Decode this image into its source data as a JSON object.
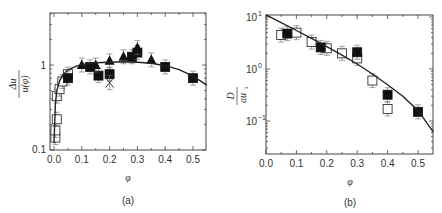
{
  "chart_data": [
    {
      "type": "scatter",
      "panel_label": "(a)",
      "xlabel": "φ",
      "ylabel": "Δu / u(φ)",
      "xlim": [
        -0.015,
        0.55
      ],
      "ylim": [
        0.1,
        4.1
      ],
      "yscale": "log",
      "xticks": [
        "0.0",
        "0.1",
        "0.2",
        "0.3",
        "0.4",
        "0.5"
      ],
      "yticks": [
        "0.1",
        "1"
      ],
      "grid": false,
      "legend": null,
      "series": [
        {
          "name": "open squares",
          "marker": "open-square",
          "x": [
            0.005,
            0.005,
            0.01,
            0.01,
            0.02,
            0.03,
            0.05
          ],
          "y": [
            0.14,
            0.17,
            0.23,
            0.43,
            0.52,
            0.64,
            0.78
          ]
        },
        {
          "name": "filled squares",
          "marker": "filled-square",
          "x": [
            0.05,
            0.13,
            0.16,
            0.2,
            0.28,
            0.3,
            0.4,
            0.5
          ],
          "y": [
            0.7,
            0.95,
            0.75,
            0.78,
            1.25,
            1.4,
            0.95,
            0.7
          ]
        },
        {
          "name": "filled triangles",
          "marker": "filled-triangle",
          "x": [
            0.1,
            0.15,
            0.2,
            0.25,
            0.3,
            0.35
          ],
          "y": [
            1.0,
            1.0,
            1.12,
            1.25,
            1.6,
            1.15
          ]
        },
        {
          "name": "crosses",
          "marker": "x",
          "x": [
            0.2
          ],
          "y": [
            0.62
          ]
        },
        {
          "name": "fit curve",
          "marker": "line",
          "x": [
            0.0,
            0.005,
            0.01,
            0.02,
            0.03,
            0.05,
            0.08,
            0.1,
            0.15,
            0.2,
            0.25,
            0.3,
            0.35,
            0.4,
            0.45,
            0.5,
            0.55
          ],
          "y": [
            0.12,
            0.35,
            0.5,
            0.65,
            0.75,
            0.87,
            0.97,
            1.01,
            1.06,
            1.08,
            1.09,
            1.08,
            1.05,
            0.98,
            0.88,
            0.74,
            0.58
          ]
        }
      ]
    },
    {
      "type": "scatter",
      "panel_label": "(b)",
      "xlabel": "φ",
      "ylabel": "D / a u_s",
      "xlim": [
        0.0,
        0.55
      ],
      "ylim": [
        0.023,
        11
      ],
      "yscale": "log",
      "xticks": [
        "0.0",
        "0.1",
        "0.2",
        "0.3",
        "0.4",
        "0.5"
      ],
      "yticks": [
        "10^-1",
        "10^0",
        "10^1"
      ],
      "grid": false,
      "legend": null,
      "series": [
        {
          "name": "open squares",
          "marker": "open-square",
          "x": [
            0.05,
            0.1,
            0.15,
            0.2,
            0.25,
            0.3,
            0.35,
            0.4
          ],
          "y": [
            4.5,
            5.0,
            3.3,
            2.5,
            2.0,
            1.6,
            0.6,
            0.17
          ]
        },
        {
          "name": "filled squares",
          "marker": "filled-square",
          "x": [
            0.07,
            0.18,
            0.3,
            0.4,
            0.5
          ],
          "y": [
            4.8,
            2.6,
            2.1,
            0.32,
            0.15
          ]
        },
        {
          "name": "fit curve",
          "marker": "line",
          "x": [
            0.0,
            0.05,
            0.1,
            0.15,
            0.2,
            0.25,
            0.3,
            0.35,
            0.4,
            0.45,
            0.5,
            0.55
          ],
          "y": [
            11,
            7.8,
            5.5,
            3.9,
            2.7,
            1.85,
            1.25,
            0.8,
            0.5,
            0.3,
            0.16,
            0.062
          ]
        }
      ]
    }
  ],
  "panels": {
    "a": {
      "caption": "(a)",
      "xlabel": "φ",
      "ylabel_num": "Δu",
      "ylabel_den": "u(φ)",
      "xticks": [
        "0.0",
        "0.1",
        "0.2",
        "0.3",
        "0.4",
        "0.5"
      ],
      "yticks": [
        "0.1",
        "1"
      ]
    },
    "b": {
      "caption": "(b)",
      "xlabel": "φ",
      "ylabel_num": "D",
      "ylabel_den": "au",
      "ylabel_sub": "s",
      "xticks": [
        "0.0",
        "0.1",
        "0.2",
        "0.3",
        "0.4",
        "0.5"
      ],
      "ytick_base": "10",
      "ytick_exps": [
        "1",
        "0",
        "−1"
      ]
    }
  }
}
